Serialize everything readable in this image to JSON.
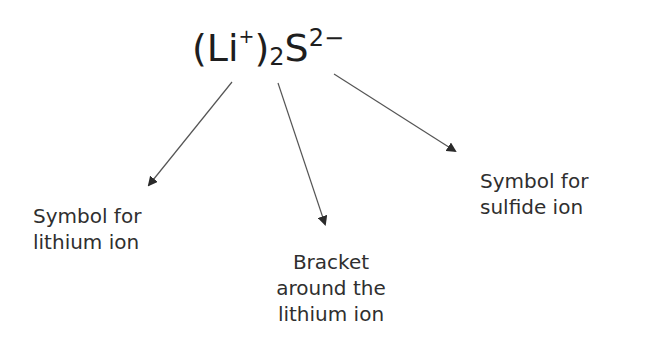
{
  "formula": {
    "open_paren": "(",
    "lithium": "Li",
    "lithium_charge": "+",
    "close_paren": ")",
    "subscript": "2",
    "sulfur": "S",
    "sulfide_charge": "2−"
  },
  "labels": {
    "lithium_ion": {
      "line1": "Symbol for",
      "line2": "lithium ion"
    },
    "bracket": {
      "line1": "Bracket",
      "line2": "around the",
      "line3": "lithium ion"
    },
    "sulfide_ion": {
      "line1": "Symbol for",
      "line2": "sulfide ion"
    }
  },
  "colors": {
    "text": "#2a2a2a",
    "arrow": "#555555",
    "background": "#ffffff"
  }
}
